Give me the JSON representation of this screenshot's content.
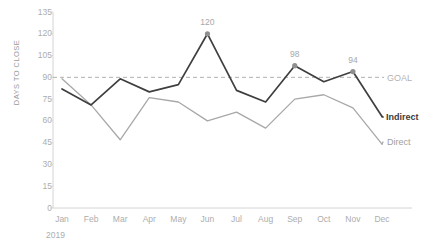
{
  "chart_data": {
    "type": "line",
    "title": "",
    "subtitle": "",
    "xlabel": "2019",
    "ylabel": "DAYS TO CLOSE",
    "categories": [
      "Jan",
      "Feb",
      "Mar",
      "Apr",
      "May",
      "Jun",
      "Jul",
      "Aug",
      "Sep",
      "Oct",
      "Nov",
      "Dec"
    ],
    "ylim": [
      0,
      135
    ],
    "yticks": [
      0,
      15,
      30,
      45,
      60,
      75,
      90,
      105,
      120,
      135
    ],
    "grid": false,
    "legend_position": "right-inline",
    "series": [
      {
        "name": "Indirect",
        "color": "#3f3f3f",
        "values": [
          82,
          71,
          89,
          80,
          85,
          120,
          81,
          73,
          98,
          87,
          94,
          63
        ]
      },
      {
        "name": "Direct",
        "color": "#a8a8a8",
        "values": [
          89,
          71,
          47,
          76,
          73,
          60,
          66,
          55,
          75,
          78,
          69,
          44
        ]
      }
    ],
    "reference_line": {
      "name": "GOAL",
      "value": 90,
      "color": "#b0b0b0",
      "style": "dashed"
    },
    "annotations": [
      {
        "category": "Jun",
        "series": "Indirect",
        "value": 120,
        "label": "120"
      },
      {
        "category": "Sep",
        "series": "Indirect",
        "value": 98,
        "label": "98"
      },
      {
        "category": "Nov",
        "series": "Indirect",
        "value": 94,
        "label": "94"
      }
    ]
  },
  "axis": {
    "y_title": "DAYS TO CLOSE",
    "y_tick_labels": [
      "135",
      "120",
      "105",
      "90",
      "75",
      "60",
      "45",
      "30",
      "15",
      "0"
    ],
    "x_tick_labels": [
      "Jan",
      "Feb",
      "Mar",
      "Apr",
      "May",
      "Jun",
      "Jul",
      "Aug",
      "Sep",
      "Oct",
      "Nov",
      "Dec"
    ],
    "year": "2019"
  },
  "legend": {
    "goal_label": "GOAL",
    "indirect_label": "Indirect",
    "direct_label": "Direct"
  },
  "colors": {
    "indirect": "#3f3f3f",
    "direct": "#a8a8a8",
    "goal": "#b0b0b0",
    "axis": "#d4d4d4",
    "tick_text": "#adadad"
  }
}
